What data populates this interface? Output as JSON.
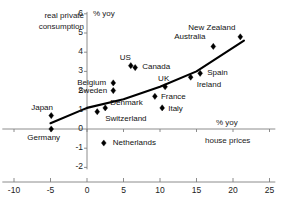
{
  "chart_data": {
    "type": "scatter",
    "title": "",
    "xlabel": "house prices",
    "ylabel": "real private consumption",
    "x_unit_label": "% yoy",
    "y_unit_label": "% yoy",
    "xlim": [
      -12,
      26
    ],
    "ylim": [
      -2,
      6
    ],
    "xticks": [
      -10,
      -5,
      0,
      5,
      10,
      15,
      20,
      25
    ],
    "yticks": [
      -2,
      -1,
      0,
      1,
      2,
      3,
      4,
      5,
      6
    ],
    "grid": false,
    "legend": "none",
    "marker": "diamond",
    "marker_color": "#000000",
    "trendline": {
      "label": "fitted trend",
      "color": "#000000",
      "points": [
        {
          "x": -5.0,
          "y": 0.3
        },
        {
          "x": 0.0,
          "y": 1.1
        },
        {
          "x": 5.0,
          "y": 1.55
        },
        {
          "x": 10.0,
          "y": 2.2
        },
        {
          "x": 15.0,
          "y": 3.0
        },
        {
          "x": 21.5,
          "y": 4.6
        }
      ]
    },
    "points": [
      {
        "name": "Japan",
        "x": -4.9,
        "y": 0.7,
        "label_dx": -20,
        "label_dy": -13
      },
      {
        "name": "Germany",
        "x": -4.9,
        "y": 0.0,
        "label_dx": -24,
        "label_dy": 4
      },
      {
        "name": "Switzerland",
        "x": 1.4,
        "y": 0.9,
        "label_dx": 8,
        "label_dy": 2
      },
      {
        "name": "Netherlands",
        "x": 2.3,
        "y": -0.73,
        "label_dx": 9,
        "label_dy": -5
      },
      {
        "name": "Sweden",
        "x": 3.6,
        "y": 2.0,
        "label_dx": -35,
        "label_dy": -5
      },
      {
        "name": "Belgium",
        "x": 3.6,
        "y": 2.4,
        "label_dx": -36,
        "label_dy": -5
      },
      {
        "name": "Denmark",
        "x": 2.5,
        "y": 1.1,
        "label_dx": 5,
        "label_dy": -10
      },
      {
        "name": "US",
        "x": 6.0,
        "y": 3.3,
        "label_dx": -11,
        "label_dy": -13
      },
      {
        "name": "Canada",
        "x": 6.6,
        "y": 3.2,
        "label_dx": 7,
        "label_dy": -6
      },
      {
        "name": "France",
        "x": 9.3,
        "y": 1.7,
        "label_dx": 6,
        "label_dy": -4
      },
      {
        "name": "Italy",
        "x": 10.3,
        "y": 1.1,
        "label_dx": 6,
        "label_dy": -4
      },
      {
        "name": "UK",
        "x": 10.7,
        "y": 2.2,
        "label_dx": -7,
        "label_dy": -13
      },
      {
        "name": "Ireland",
        "x": 14.2,
        "y": 2.7,
        "label_dx": 6,
        "label_dy": 3
      },
      {
        "name": "Spain",
        "x": 15.5,
        "y": 2.9,
        "label_dx": 7,
        "label_dy": -5
      },
      {
        "name": "Australia",
        "x": 17.3,
        "y": 4.3,
        "label_dx": -39,
        "label_dy": -14
      },
      {
        "name": "New Zealand",
        "x": 21.0,
        "y": 4.8,
        "label_dx": -52,
        "label_dy": -14
      }
    ]
  },
  "axes": {
    "x_axis_name": "house prices",
    "y_axis_name": "real private consumption",
    "y_unit": "% yoy",
    "x_unit": "% yoy",
    "x_tick_labels": [
      "-10",
      "-5",
      "0",
      "5",
      "10",
      "15",
      "20",
      "25"
    ],
    "y_tick_labels": [
      "6",
      "5",
      "4",
      "3",
      "2",
      "1",
      "0",
      "-1",
      "-2"
    ]
  },
  "corner_caption": {
    "line1": "real private",
    "line2": "consumption"
  },
  "point_labels": {
    "japan": "Japan",
    "germany": "Germany",
    "switzerland": "Switzerland",
    "netherlands": "Netherlands",
    "sweden": "Sweden",
    "belgium": "Belgium",
    "denmark": "Denmark",
    "us": "US",
    "canada": "Canada",
    "france": "France",
    "italy": "Italy",
    "uk": "UK",
    "ireland": "Ireland",
    "spain": "Spain",
    "australia": "Australia",
    "new_zealand": "New Zealand"
  },
  "colors": {
    "marker": "#000000",
    "trendline": "#000000",
    "axis": "#808080",
    "text": "#111111",
    "background": "#ffffff"
  }
}
